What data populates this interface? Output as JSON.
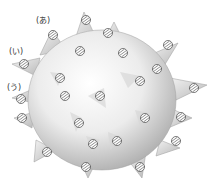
{
  "figure": {
    "labels": [
      {
        "id": "a",
        "text": "(あ)",
        "x": 36,
        "y": 17
      },
      {
        "id": "i",
        "text": "(い)",
        "x": 9,
        "y": 48
      },
      {
        "id": "u",
        "text": "(う)",
        "x": 7,
        "y": 84
      }
    ],
    "markers": [
      {
        "x": 53,
        "y": 35,
        "r": 4.5
      },
      {
        "x": 24,
        "y": 64,
        "r": 4.5
      },
      {
        "x": 21,
        "y": 99,
        "r": 4.5
      },
      {
        "x": 86,
        "y": 20,
        "r": 4.5
      },
      {
        "x": 108,
        "y": 33,
        "r": 4.5
      },
      {
        "x": 80,
        "y": 51,
        "r": 4.5
      },
      {
        "x": 123,
        "y": 53,
        "r": 4.5
      },
      {
        "x": 168,
        "y": 45,
        "r": 4.5
      },
      {
        "x": 157,
        "y": 69,
        "r": 4.5
      },
      {
        "x": 140,
        "y": 81,
        "r": 4.5
      },
      {
        "x": 194,
        "y": 88,
        "r": 4.5
      },
      {
        "x": 60,
        "y": 78,
        "r": 4.5
      },
      {
        "x": 65,
        "y": 96,
        "r": 4.5
      },
      {
        "x": 100,
        "y": 96,
        "r": 4.5
      },
      {
        "x": 145,
        "y": 118,
        "r": 4.5
      },
      {
        "x": 181,
        "y": 117,
        "r": 4.5
      },
      {
        "x": 117,
        "y": 141,
        "r": 4.5
      },
      {
        "x": 176,
        "y": 141,
        "r": 4.5
      },
      {
        "x": 79,
        "y": 123,
        "r": 4.5
      },
      {
        "x": 93,
        "y": 144,
        "r": 4.5
      },
      {
        "x": 47,
        "y": 152,
        "r": 4.5
      },
      {
        "x": 86,
        "y": 167,
        "r": 4.5
      },
      {
        "x": 140,
        "y": 167,
        "r": 4.5
      },
      {
        "x": 22,
        "y": 118,
        "r": 4.5
      }
    ],
    "colors": {
      "body_light": "#f7f7f7",
      "body_dark": "#b5b5b5",
      "outline": "#8a8a8a",
      "marker_fill": "#ffffff",
      "marker_stroke": "#444444"
    }
  }
}
